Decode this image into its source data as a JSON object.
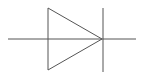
{
  "diagram": {
    "type": "schematic-symbol",
    "symbol": "diode",
    "background": "#ffffff",
    "stroke_color": "#555555",
    "stroke_width": 1,
    "lead_wire": {
      "x1": 8,
      "y1": 39,
      "x2": 136,
      "y2": 39
    },
    "anode_triangle": {
      "points": "48,8 48,70 102,39"
    },
    "cathode_bar": {
      "x1": 103,
      "y1": 8,
      "x2": 103,
      "y2": 72
    }
  }
}
